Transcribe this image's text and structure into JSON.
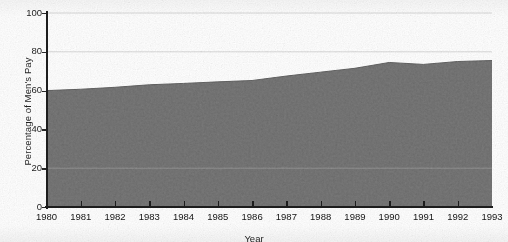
{
  "chart_data": {
    "type": "area",
    "title": "",
    "xlabel": "Year",
    "ylabel": "Percentage of Men's Pay",
    "x": [
      1980,
      1981,
      1982,
      1983,
      1984,
      1985,
      1986,
      1987,
      1988,
      1989,
      1990,
      1991,
      1992,
      1993
    ],
    "values": [
      60.0,
      60.7,
      61.7,
      63.0,
      63.7,
      64.5,
      65.2,
      67.5,
      69.5,
      71.5,
      74.5,
      73.5,
      75.0,
      75.5
    ],
    "series": [
      {
        "name": "Percentage of Men's Pay",
        "values": [
          60.0,
          60.7,
          61.7,
          63.0,
          63.7,
          64.5,
          65.2,
          67.5,
          69.5,
          71.5,
          74.5,
          73.5,
          75.0,
          75.5
        ]
      }
    ],
    "xlim": [
      1980,
      1993
    ],
    "ylim": [
      0,
      100
    ],
    "ytick_labels": [
      "0",
      "20",
      "40",
      "60",
      "80",
      "100"
    ],
    "ytick_values": [
      0,
      20,
      40,
      60,
      80,
      100
    ],
    "xtick_labels": [
      "1980",
      "1981",
      "1982",
      "1983",
      "1984",
      "1985",
      "1986",
      "1987",
      "1988",
      "1989",
      "1990",
      "1991",
      "1992",
      "1993"
    ],
    "gridlines": [
      20,
      80,
      100
    ],
    "grid": true,
    "legend": "none",
    "fill_color": "#6e6e6e",
    "line_color": "#5a5a5a",
    "axis_color": "#1d1d1d",
    "grid_color": "#d8d8d8",
    "background_color": "#ffffff"
  },
  "axes": {
    "ylabel": "Percentage of Men's Pay",
    "xlabel": "Year"
  }
}
